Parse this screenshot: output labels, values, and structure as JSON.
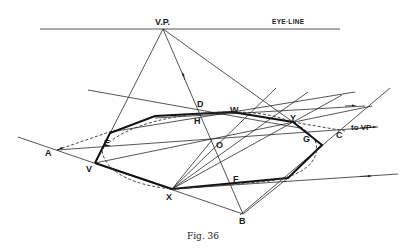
{
  "figure": {
    "caption": "Fig. 36",
    "eye_line_label": "Eye-Line",
    "vp_label": "V.P.",
    "to_vp_label": "to VP",
    "point_labels": {
      "A": "A",
      "V": "V",
      "E": "E",
      "D": "D",
      "H": "H",
      "W": "W",
      "O": "O",
      "Y": "Y",
      "G": "G",
      "C": "C",
      "F": "F",
      "X": "X",
      "B": "B"
    }
  }
}
